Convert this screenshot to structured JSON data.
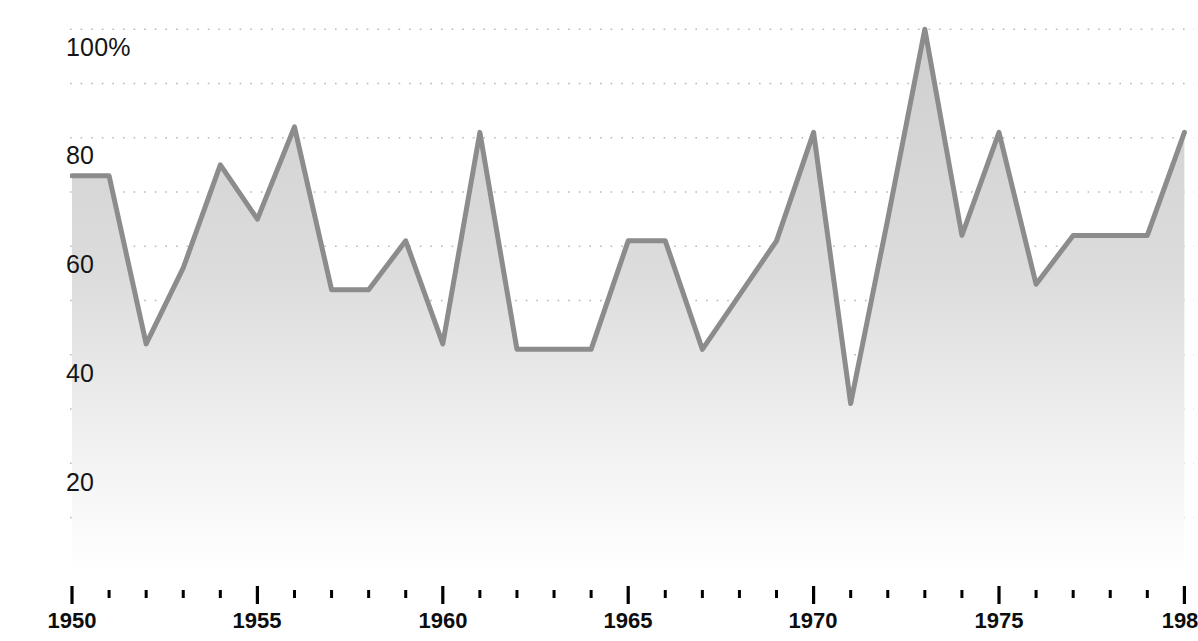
{
  "chart_data": {
    "type": "area",
    "title": "",
    "xlabel": "",
    "ylabel": "5/6 Nations home win rate (%)",
    "xlim": [
      1949.6,
      1980.3
    ],
    "ylim": [
      0,
      105
    ],
    "grid": true,
    "legend": false,
    "series_name": "5/6 Nations home win rate",
    "line_color": "#8c8c8c",
    "fill_color": "#d4d4d4",
    "grid_color": "#b9b9b9",
    "y_major_ticks": [
      100,
      80,
      60,
      40,
      20
    ],
    "y_major_tick_labels": [
      "100%",
      "80",
      "60",
      "40",
      "20"
    ],
    "y_gridlines": [
      100,
      90,
      80,
      70,
      60,
      50,
      40,
      30,
      20,
      10
    ],
    "x_major_ticks": [
      1950,
      1955,
      1960,
      1965,
      1970,
      1980
    ],
    "x_major_tick_labels": [
      "1950",
      "1955",
      "1960",
      "1965",
      "1970",
      "1975",
      "198"
    ],
    "x_minor_tick_years": [
      1951,
      1952,
      1953,
      1954,
      1956,
      1957,
      1958,
      1959,
      1961,
      1962,
      1963,
      1964,
      1966,
      1967,
      1968,
      1969,
      1971,
      1972,
      1973,
      1974,
      1976,
      1977,
      1978,
      1979
    ],
    "x": [
      1950,
      1951,
      1952,
      1953,
      1954,
      1955,
      1956,
      1957,
      1958,
      1959,
      1960,
      1961,
      1962,
      1963,
      1964,
      1965,
      1966,
      1967,
      1968,
      1969,
      1970,
      1971,
      1972,
      1973,
      1974,
      1975,
      1976,
      1977,
      1978,
      1979,
      1980
    ],
    "values": [
      73,
      73,
      42,
      56,
      75,
      65,
      82,
      52,
      52,
      61,
      42,
      81,
      41,
      41,
      41,
      61,
      61,
      41,
      51,
      61,
      81,
      31,
      65,
      100,
      62,
      81,
      53,
      62,
      62,
      62,
      81
    ]
  },
  "axis": {
    "y_title": "5/6 Nations home win rate (%)",
    "y_labels": [
      {
        "text": "100%",
        "value": 100
      },
      {
        "text": "80",
        "value": 80
      },
      {
        "text": "60",
        "value": 60
      },
      {
        "text": "40",
        "value": 40
      },
      {
        "text": "20",
        "value": 20
      }
    ],
    "x_labels": [
      {
        "text": "1950",
        "value": 1950
      },
      {
        "text": "1955",
        "value": 1955
      },
      {
        "text": "1960",
        "value": 1960
      },
      {
        "text": "1965",
        "value": 1965
      },
      {
        "text": "1970",
        "value": 1970
      },
      {
        "text": "1975",
        "value": 1975
      },
      {
        "text": "198",
        "value": 1980
      }
    ]
  }
}
